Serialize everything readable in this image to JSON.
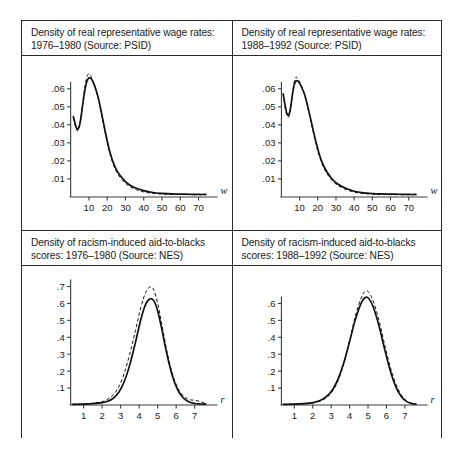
{
  "figure": {
    "panels": [
      {
        "id": "wage-1976-1980",
        "title": "Density of real representative wage rates:\n1976–1980 (Source: PSID)"
      },
      {
        "id": "wage-1988-1992",
        "title": "Density of real representative wage rates:\n1988–1992 (Source: PSID)"
      },
      {
        "id": "racism-1976-1980",
        "title": "Density of racism-induced aid-to-blacks\nscores: 1976–1980 (Source: NES)"
      },
      {
        "id": "racism-1988-1992",
        "title": "Density of racism-induced aid-to-blacks\nscores: 1988–1992 (Source: NES)"
      }
    ]
  },
  "chart_data": [
    {
      "type": "line",
      "panel": "top-left",
      "title": "Density of real representative wage rates: 1976–1980 (Source: PSID)",
      "source": "PSID",
      "period": "1976–1980",
      "xlabel": "w",
      "ylabel": "",
      "xlim": [
        0,
        75
      ],
      "ylim": [
        0,
        0.071
      ],
      "xticks": [
        10,
        20,
        30,
        40,
        50,
        60,
        70
      ],
      "xtick_labels": [
        "10",
        "20",
        "30",
        "40",
        "50",
        "60",
        "70"
      ],
      "yticks": [
        0.01,
        0.02,
        0.03,
        0.04,
        0.05,
        0.06
      ],
      "ytick_labels": [
        ".01",
        ".02",
        ".03",
        ".04",
        ".05",
        ".06"
      ],
      "grid": false,
      "legend": null,
      "series": [
        {
          "name": "density estimate",
          "style": "solid",
          "x": [
            1.5,
            2.5,
            3.5,
            4.5,
            5.5,
            6.5,
            7.5,
            8.5,
            9.5,
            10.5,
            11.5,
            13,
            15,
            17,
            19,
            21,
            23,
            25,
            27,
            30,
            33,
            36,
            40,
            45,
            50,
            55,
            60,
            65,
            70,
            74
          ],
          "y": [
            0.0445,
            0.0405,
            0.0378,
            0.0385,
            0.0432,
            0.0505,
            0.0575,
            0.0628,
            0.0655,
            0.066,
            0.0652,
            0.062,
            0.0555,
            0.046,
            0.036,
            0.0268,
            0.02,
            0.0152,
            0.012,
            0.0085,
            0.0062,
            0.0048,
            0.0035,
            0.0025,
            0.002,
            0.0017,
            0.0016,
            0.0015,
            0.0014,
            0.0014
          ]
        },
        {
          "name": "confidence band",
          "style": "dashed",
          "x": [
            1.5,
            2.5,
            3.5,
            4.5,
            5.5,
            6.5,
            7.5,
            8.5,
            9.5,
            10.5,
            11.5,
            13,
            15,
            17,
            19,
            21,
            23,
            25,
            27,
            30,
            33,
            36,
            40,
            45,
            50,
            55,
            60,
            65,
            70,
            74
          ],
          "y": [
            0.044,
            0.0398,
            0.0368,
            0.0378,
            0.043,
            0.0512,
            0.0592,
            0.0652,
            0.068,
            0.0678,
            0.0662,
            0.062,
            0.0548,
            0.0452,
            0.035,
            0.0258,
            0.019,
            0.0142,
            0.011,
            0.0076,
            0.0054,
            0.004,
            0.0028,
            0.002,
            0.0016,
            0.0014,
            0.0014,
            0.0013,
            0.0013,
            0.0013
          ]
        }
      ]
    },
    {
      "type": "line",
      "panel": "top-right",
      "title": "Density of real representative wage rates: 1988–1992 (Source: PSID)",
      "source": "PSID",
      "period": "1988–1992",
      "xlabel": "w",
      "ylabel": "",
      "xlim": [
        0,
        75
      ],
      "ylim": [
        0,
        0.071
      ],
      "xticks": [
        10,
        20,
        30,
        40,
        50,
        60,
        70
      ],
      "xtick_labels": [
        "10",
        "20",
        "30",
        "40",
        "50",
        "60",
        "70"
      ],
      "yticks": [
        0.01,
        0.02,
        0.03,
        0.04,
        0.05,
        0.06
      ],
      "ytick_labels": [
        ".01",
        ".02",
        ".03",
        ".04",
        ".05",
        ".06"
      ],
      "grid": false,
      "legend": null,
      "series": [
        {
          "name": "density estimate",
          "style": "solid",
          "x": [
            1.0,
            2.0,
            3.0,
            4.0,
            5.0,
            6.0,
            7.0,
            8.0,
            9.0,
            10.0,
            11.5,
            13,
            15,
            17,
            19,
            21,
            23,
            25,
            28,
            31,
            35,
            40,
            45,
            50,
            55,
            60,
            65,
            70,
            74
          ],
          "y": [
            0.0572,
            0.051,
            0.0463,
            0.0455,
            0.0492,
            0.0562,
            0.062,
            0.0644,
            0.0642,
            0.063,
            0.06,
            0.056,
            0.048,
            0.0392,
            0.0305,
            0.0232,
            0.0178,
            0.014,
            0.0098,
            0.0072,
            0.005,
            0.0032,
            0.0023,
            0.0019,
            0.0017,
            0.0016,
            0.0015,
            0.0014,
            0.0014
          ]
        },
        {
          "name": "confidence band",
          "style": "dashed",
          "x": [
            1.0,
            2.0,
            3.0,
            4.0,
            5.0,
            6.0,
            7.0,
            8.0,
            9.0,
            10.0,
            11.5,
            13,
            15,
            17,
            19,
            21,
            23,
            25,
            28,
            31,
            35,
            40,
            45,
            50,
            55,
            60,
            65,
            70,
            74
          ],
          "y": [
            0.0566,
            0.05,
            0.0452,
            0.0443,
            0.0488,
            0.057,
            0.0638,
            0.0664,
            0.0656,
            0.064,
            0.0604,
            0.0558,
            0.0474,
            0.0382,
            0.0294,
            0.0222,
            0.0168,
            0.013,
            0.009,
            0.0064,
            0.0043,
            0.0027,
            0.0019,
            0.0016,
            0.0014,
            0.0013,
            0.0013,
            0.0013,
            0.0013
          ]
        }
      ]
    },
    {
      "type": "line",
      "panel": "bottom-left",
      "title": "Density of racism-induced aid-to-blacks scores: 1976–1980 (Source: NES)",
      "source": "NES",
      "period": "1976–1980",
      "xlabel": "r",
      "ylabel": "",
      "xlim": [
        0.3,
        7.7
      ],
      "ylim": [
        0,
        0.745
      ],
      "xticks": [
        1,
        2,
        3,
        4,
        5,
        6,
        7
      ],
      "xtick_labels": [
        "1",
        "2",
        "3",
        "4",
        "5",
        "6",
        "7"
      ],
      "yticks": [
        0.1,
        0.2,
        0.3,
        0.4,
        0.5,
        0.6,
        0.7
      ],
      "ytick_labels": [
        ".1",
        ".2",
        ".3",
        ".4",
        ".5",
        ".6",
        ".7"
      ],
      "grid": false,
      "legend": null,
      "series": [
        {
          "name": "density estimate",
          "style": "solid",
          "x": [
            0.4,
            1.0,
            1.5,
            2.0,
            2.3,
            2.6,
            2.9,
            3.2,
            3.5,
            3.8,
            4.1,
            4.35,
            4.6,
            4.8,
            5.0,
            5.2,
            5.5,
            5.8,
            6.1,
            6.4,
            6.7,
            7.0,
            7.3,
            7.6
          ],
          "y": [
            0.004,
            0.005,
            0.008,
            0.014,
            0.022,
            0.04,
            0.075,
            0.14,
            0.24,
            0.37,
            0.51,
            0.595,
            0.628,
            0.615,
            0.555,
            0.46,
            0.3,
            0.17,
            0.085,
            0.04,
            0.018,
            0.009,
            0.006,
            0.005
          ]
        },
        {
          "name": "confidence band",
          "style": "dashed",
          "x": [
            0.4,
            1.0,
            1.5,
            2.0,
            2.3,
            2.6,
            2.9,
            3.2,
            3.5,
            3.8,
            4.1,
            4.35,
            4.6,
            4.8,
            5.0,
            5.2,
            5.5,
            5.8,
            6.1,
            6.4,
            6.7,
            7.0,
            7.3,
            7.6
          ],
          "y": [
            0.004,
            0.006,
            0.01,
            0.02,
            0.034,
            0.06,
            0.108,
            0.19,
            0.305,
            0.44,
            0.58,
            0.665,
            0.698,
            0.678,
            0.6,
            0.49,
            0.318,
            0.182,
            0.098,
            0.052,
            0.032,
            0.028,
            0.02,
            0.008
          ]
        }
      ]
    },
    {
      "type": "line",
      "panel": "bottom-right",
      "title": "Density of racism-induced aid-to-blacks scores: 1988–1992 (Source: NES)",
      "source": "NES",
      "period": "1988–1992",
      "xlabel": "r",
      "ylabel": "",
      "xlim": [
        0.3,
        7.7
      ],
      "ylim": [
        0,
        0.745
      ],
      "xticks": [
        1,
        2,
        3,
        4,
        5,
        6,
        7
      ],
      "xtick_labels": [
        "1",
        "2",
        "3",
        "4",
        "5",
        "6",
        "7"
      ],
      "yticks": [
        0.1,
        0.2,
        0.3,
        0.4,
        0.5,
        0.6
      ],
      "ytick_labels": [
        ".1",
        ".2",
        ".3",
        ".4",
        ".5",
        ".6"
      ],
      "grid": false,
      "legend": null,
      "series": [
        {
          "name": "density estimate",
          "style": "solid",
          "x": [
            0.4,
            1.0,
            1.5,
            2.0,
            2.4,
            2.8,
            3.1,
            3.4,
            3.7,
            4.0,
            4.3,
            4.6,
            4.85,
            5.05,
            5.3,
            5.6,
            5.9,
            6.2,
            6.5,
            6.8,
            7.1,
            7.4,
            7.6
          ],
          "y": [
            0.004,
            0.005,
            0.008,
            0.014,
            0.026,
            0.055,
            0.095,
            0.16,
            0.255,
            0.375,
            0.5,
            0.595,
            0.635,
            0.628,
            0.575,
            0.465,
            0.33,
            0.205,
            0.11,
            0.05,
            0.02,
            0.008,
            0.005
          ]
        },
        {
          "name": "confidence band",
          "style": "dashed",
          "x": [
            0.4,
            1.0,
            1.5,
            2.0,
            2.4,
            2.8,
            3.1,
            3.4,
            3.7,
            4.0,
            4.3,
            4.6,
            4.85,
            5.05,
            5.3,
            5.6,
            5.9,
            6.2,
            6.5,
            6.8,
            7.1,
            7.4,
            7.6
          ],
          "y": [
            0.004,
            0.005,
            0.007,
            0.012,
            0.022,
            0.048,
            0.086,
            0.15,
            0.25,
            0.382,
            0.52,
            0.625,
            0.672,
            0.665,
            0.608,
            0.498,
            0.358,
            0.228,
            0.126,
            0.06,
            0.024,
            0.009,
            0.005
          ]
        }
      ]
    }
  ]
}
